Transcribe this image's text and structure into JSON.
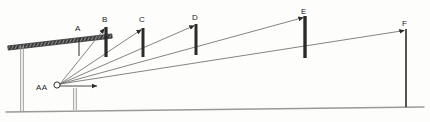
{
  "diagram": {
    "style": {
      "ink": "#2b2b2b",
      "ray": "#6e6e6e",
      "ground": "#9a9a9a",
      "post": "#9b9b9b",
      "background": "#fdfdfc"
    },
    "origin": {
      "label": "AA",
      "label_x": 36,
      "label_y": 84,
      "marker_x": 57,
      "marker_y": 85,
      "marker_r": 3.1
    },
    "ground_line": {
      "name": "ground",
      "x1": 6,
      "y1": 112,
      "x2": 424,
      "y2": 107
    },
    "beam": {
      "name": "hatched-beam",
      "x1": 8,
      "y1": 48,
      "x2": 112,
      "y2": 36,
      "thickness": 4.2,
      "hatch_count": 34
    },
    "supports": [
      {
        "name": "support-post-left",
        "x": 22,
        "y_top": 46,
        "y_bottom": 111,
        "gap": 2.6
      },
      {
        "name": "support-post-mid",
        "x": 75,
        "y_top": 88,
        "y_bottom": 110,
        "gap": 2.6
      }
    ],
    "origin_arrow": {
      "name": "horizontal-sight-arrow",
      "x1": 60,
      "y1": 86,
      "x2": 97,
      "y2": 86
    },
    "poles": [
      {
        "id": "A",
        "label": "A",
        "x": 79,
        "y_top": 38,
        "y_bottom": 56,
        "width": 1.0,
        "label_x": 75,
        "label_y": 25,
        "ray": false,
        "arrow": false
      },
      {
        "id": "B",
        "label": "B",
        "x": 106,
        "y_top": 27,
        "y_bottom": 57,
        "width": 3.2,
        "label_x": 102,
        "label_y": 16,
        "ray": true,
        "arrow": true
      },
      {
        "id": "C",
        "label": "C",
        "x": 143,
        "y_top": 28,
        "y_bottom": 57,
        "width": 3.0,
        "label_x": 139,
        "label_y": 16,
        "ray": true,
        "arrow": true
      },
      {
        "id": "D",
        "label": "D",
        "x": 196,
        "y_top": 24,
        "y_bottom": 55,
        "width": 3.0,
        "label_x": 192,
        "label_y": 14,
        "ray": true,
        "arrow": true
      },
      {
        "id": "E",
        "label": "E",
        "x": 305,
        "y_top": 16,
        "y_bottom": 58,
        "width": 3.4,
        "label_x": 301,
        "label_y": 8,
        "ray": true,
        "arrow": true
      },
      {
        "id": "F",
        "label": "F",
        "x": 406,
        "y_top": 29,
        "y_bottom": 107,
        "width": 1.6,
        "label_x": 402,
        "label_y": 20,
        "ray": true,
        "arrow": true
      }
    ]
  }
}
